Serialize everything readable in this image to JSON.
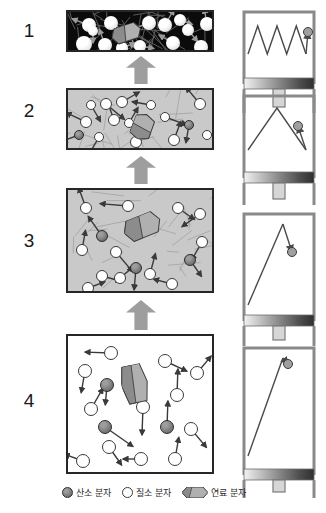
{
  "figure": {
    "stage_numbers": [
      "1",
      "2",
      "3",
      "4"
    ],
    "colors": {
      "chamber_border": "#262626",
      "gas_gray": "#c9c9c9",
      "chamber_dark": "#0b0b0b",
      "flow_arrow": "#9e9e9e",
      "oxygen": "#6e6e6e",
      "nitrogen": "#ffffff",
      "fuel": "#8f8f8f",
      "piston_stroke": "#8a8a8a"
    }
  },
  "stages": [
    {
      "number": "1",
      "name": "exhaust-hot-gas",
      "chamber_fill": "dark",
      "chamber": {
        "x": 66,
        "y": 10,
        "w": 148,
        "h": 42
      },
      "piston": {
        "x": 240,
        "y": 8,
        "w": 78,
        "h": 70,
        "spring_peaks": 3,
        "spring_top": 14,
        "spring_bottom": 46,
        "ball_x": 68,
        "ball_y": 20,
        "rod_h": 18
      }
    },
    {
      "number": "2",
      "name": "combustion-expansion",
      "chamber_fill": "gray",
      "chamber": {
        "x": 66,
        "y": 88,
        "w": 148,
        "h": 62
      },
      "piston": {
        "x": 240,
        "y": 92,
        "w": 78,
        "h": 80,
        "spring_peaks": 1,
        "spring_top": 12,
        "spring_bottom": 58,
        "ball_x": 58,
        "ball_y": 30,
        "rod_h": 16
      }
    },
    {
      "number": "3",
      "name": "compression",
      "chamber_fill": "gray",
      "chamber": {
        "x": 66,
        "y": 188,
        "w": 148,
        "h": 105
      },
      "piston": {
        "x": 240,
        "y": 210,
        "w": 78,
        "h": 105,
        "spring_peaks": 0,
        "spring_top": 10,
        "spring_bottom": 95,
        "ball_x": 52,
        "ball_y": 38,
        "rod_h": 14
      }
    },
    {
      "number": "4",
      "name": "intake-cool-mixture",
      "chamber_fill": "white",
      "chamber": {
        "x": 66,
        "y": 334,
        "w": 148,
        "h": 140
      },
      "piston": {
        "x": 240,
        "y": 344,
        "w": 78,
        "h": 125,
        "spring_peaks": 0,
        "spring_top": 10,
        "spring_bottom": 112,
        "ball_x": 48,
        "ball_y": 16,
        "rod_h": 12
      }
    }
  ],
  "flow_arrows": [
    {
      "name": "flow-arrow-3-to-2",
      "x": 126,
      "y": 300,
      "w": 30,
      "h": 30
    },
    {
      "name": "flow-arrow-2-to-1",
      "x": 126,
      "y": 156,
      "w": 30,
      "h": 28
    },
    {
      "name": "flow-arrow-1",
      "x": 126,
      "y": 56,
      "w": 30,
      "h": 28
    }
  ],
  "legend": {
    "x": 62,
    "y": 486,
    "items": [
      {
        "icon": "oxygen-molecule-icon",
        "label": "산소 분자"
      },
      {
        "icon": "nitrogen-molecule-icon",
        "label": "질소 분자"
      },
      {
        "icon": "fuel-molecule-icon",
        "label": "연료 분자"
      }
    ]
  },
  "molecules": {
    "stage1": [
      {
        "t": "n2",
        "x": 14,
        "y": 6,
        "r": 7,
        "a": 200,
        "l": 18
      },
      {
        "t": "n2",
        "x": 36,
        "y": 4,
        "r": 7,
        "a": 30,
        "l": 16
      },
      {
        "t": "n2",
        "x": 8,
        "y": 24,
        "r": 8,
        "a": 120,
        "l": 20
      },
      {
        "t": "n2",
        "x": 30,
        "y": 26,
        "r": 7,
        "a": 250,
        "l": 17
      },
      {
        "t": "n2",
        "x": 56,
        "y": 16,
        "r": 6,
        "a": 70,
        "l": 15
      },
      {
        "t": "n2",
        "x": 74,
        "y": 4,
        "r": 7,
        "a": 160,
        "l": 19
      },
      {
        "t": "n2",
        "x": 66,
        "y": 28,
        "r": 6,
        "a": 10,
        "l": 14
      },
      {
        "t": "n2",
        "x": 90,
        "y": 6,
        "r": 7,
        "a": 300,
        "l": 18
      },
      {
        "t": "n2",
        "x": 98,
        "y": 24,
        "r": 7,
        "a": 210,
        "l": 16
      },
      {
        "t": "n2",
        "x": 114,
        "y": 12,
        "r": 6,
        "a": 50,
        "l": 15
      },
      {
        "t": "n2",
        "x": 126,
        "y": 28,
        "r": 7,
        "a": 140,
        "l": 17
      },
      {
        "t": "n2",
        "x": 132,
        "y": 5,
        "r": 7,
        "a": 260,
        "l": 16
      },
      {
        "t": "n2",
        "x": 48,
        "y": 30,
        "r": 6,
        "a": 340,
        "l": 14
      },
      {
        "t": "n2",
        "x": 20,
        "y": 14,
        "r": 5,
        "a": 90,
        "l": 12
      },
      {
        "t": "n2",
        "x": 106,
        "y": 2,
        "r": 6,
        "a": 20,
        "l": 13
      }
    ],
    "stage2": [
      {
        "t": "n2",
        "x": 12,
        "y": 26,
        "r": 6,
        "a": 205,
        "l": 22
      },
      {
        "t": "n2",
        "x": 32,
        "y": 8,
        "r": 6,
        "a": 40,
        "l": 24
      },
      {
        "t": "n2",
        "x": 48,
        "y": 6,
        "r": 6,
        "a": 330,
        "l": 20
      },
      {
        "t": "n2",
        "x": 26,
        "y": 42,
        "r": 5,
        "a": 120,
        "l": 20
      },
      {
        "t": "n2",
        "x": 40,
        "y": 24,
        "r": 6,
        "a": 250,
        "l": 22
      },
      {
        "t": "o2",
        "x": 6,
        "y": 40,
        "r": 5,
        "a": 160,
        "l": 18
      },
      {
        "t": "n2",
        "x": 62,
        "y": 46,
        "r": 6,
        "a": 70,
        "l": 21
      },
      {
        "t": "n2",
        "x": 78,
        "y": 10,
        "r": 5,
        "a": 190,
        "l": 19
      },
      {
        "t": "n2",
        "x": 92,
        "y": 22,
        "r": 5,
        "a": 20,
        "l": 23
      },
      {
        "t": "n2",
        "x": 100,
        "y": 44,
        "r": 6,
        "a": 290,
        "l": 20
      },
      {
        "t": "o2",
        "x": 116,
        "y": 30,
        "r": 5,
        "a": 100,
        "l": 18
      },
      {
        "t": "n2",
        "x": 126,
        "y": 8,
        "r": 6,
        "a": 230,
        "l": 22
      },
      {
        "t": "n2",
        "x": 134,
        "y": 40,
        "r": 5,
        "a": 350,
        "l": 17
      },
      {
        "t": "n2",
        "x": 18,
        "y": 10,
        "r": 5,
        "a": 60,
        "l": 19
      },
      {
        "t": "n2",
        "x": 56,
        "y": 28,
        "r": 5,
        "a": 300,
        "l": 18
      }
    ],
    "stage3": [
      {
        "t": "n2",
        "x": 12,
        "y": 12,
        "r": 6,
        "a": 250,
        "l": 22
      },
      {
        "t": "n2",
        "x": 54,
        "y": 10,
        "r": 6,
        "a": 185,
        "l": 28
      },
      {
        "t": "n2",
        "x": 104,
        "y": 12,
        "r": 6,
        "a": 35,
        "l": 20
      },
      {
        "t": "n2",
        "x": 126,
        "y": 18,
        "r": 6,
        "a": 145,
        "l": 22
      },
      {
        "t": "o2",
        "x": 28,
        "y": 40,
        "r": 6,
        "a": 235,
        "l": 24
      },
      {
        "t": "n2",
        "x": 8,
        "y": 54,
        "r": 6,
        "a": 280,
        "l": 20
      },
      {
        "t": "n2",
        "x": 42,
        "y": 56,
        "r": 6,
        "a": 50,
        "l": 26
      },
      {
        "t": "o2",
        "x": 62,
        "y": 72,
        "r": 6,
        "a": 95,
        "l": 22
      },
      {
        "t": "n2",
        "x": 76,
        "y": 78,
        "r": 6,
        "a": 285,
        "l": 21
      },
      {
        "t": "n2",
        "x": 28,
        "y": 80,
        "r": 6,
        "a": 15,
        "l": 20
      },
      {
        "t": "n2",
        "x": 46,
        "y": 82,
        "r": 6,
        "a": 320,
        "l": 18
      },
      {
        "t": "o2",
        "x": 116,
        "y": 64,
        "r": 6,
        "a": 55,
        "l": 20
      },
      {
        "t": "n2",
        "x": 98,
        "y": 88,
        "r": 6,
        "a": 195,
        "l": 19
      },
      {
        "t": "n2",
        "x": 128,
        "y": 46,
        "r": 6,
        "a": 120,
        "l": 21
      },
      {
        "t": "n2",
        "x": 14,
        "y": 92,
        "r": 6,
        "a": 340,
        "l": 18
      }
    ],
    "stage4": [
      {
        "t": "n2",
        "x": 36,
        "y": 10,
        "r": 7,
        "a": 182,
        "l": 26
      },
      {
        "t": "n2",
        "x": 10,
        "y": 28,
        "r": 7,
        "a": 100,
        "l": 22
      },
      {
        "t": "o2",
        "x": 32,
        "y": 42,
        "r": 7,
        "a": 95,
        "l": 20
      },
      {
        "t": "n2",
        "x": 90,
        "y": 18,
        "r": 7,
        "a": 25,
        "l": 24
      },
      {
        "t": "n2",
        "x": 122,
        "y": 30,
        "r": 7,
        "a": 310,
        "l": 22
      },
      {
        "t": "n2",
        "x": 102,
        "y": 52,
        "r": 7,
        "a": 272,
        "l": 26
      },
      {
        "t": "n2",
        "x": 16,
        "y": 66,
        "r": 7,
        "a": 300,
        "l": 24
      },
      {
        "t": "o2",
        "x": 30,
        "y": 84,
        "r": 7,
        "a": 35,
        "l": 34
      },
      {
        "t": "n2",
        "x": 68,
        "y": 64,
        "r": 7,
        "a": 92,
        "l": 28
      },
      {
        "t": "o2",
        "x": 92,
        "y": 84,
        "r": 7,
        "a": 272,
        "l": 26
      },
      {
        "t": "n2",
        "x": 116,
        "y": 86,
        "r": 7,
        "a": 50,
        "l": 24
      },
      {
        "t": "n2",
        "x": 34,
        "y": 104,
        "r": 7,
        "a": 55,
        "l": 22
      },
      {
        "t": "n2",
        "x": 8,
        "y": 118,
        "r": 7,
        "a": 200,
        "l": 20
      },
      {
        "t": "n2",
        "x": 66,
        "y": 116,
        "r": 7,
        "a": 180,
        "l": 18
      },
      {
        "t": "n2",
        "x": 100,
        "y": 116,
        "r": 7,
        "a": 280,
        "l": 22
      }
    ]
  },
  "fuel_positions": [
    {
      "stage": 1,
      "x": 44,
      "y": 12,
      "w": 30,
      "h": 16,
      "rot": -18
    },
    {
      "stage": 2,
      "x": 62,
      "y": 22,
      "w": 26,
      "h": 20,
      "rot": -70
    },
    {
      "stage": 3,
      "x": 56,
      "y": 24,
      "w": 38,
      "h": 22,
      "rot": -22
    },
    {
      "stage": 4,
      "x": 54,
      "y": 28,
      "w": 26,
      "h": 38,
      "rot": -12
    }
  ]
}
